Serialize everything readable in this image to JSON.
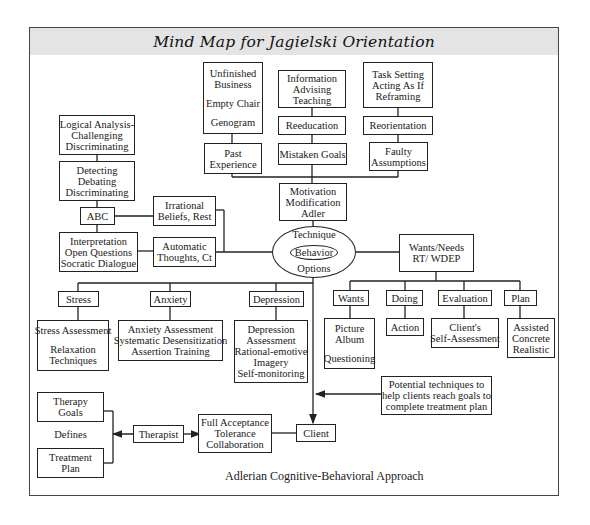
{
  "title": "Mind Map for Jagielski Orientation",
  "caption": "Adlerian Cognitive-Behavioral Approach",
  "center": {
    "top": "Technique",
    "inner": "Behavior",
    "bottom": "Options"
  },
  "top_branch": {
    "hub": [
      "Motivation",
      "Modification",
      "Adler"
    ],
    "columns": [
      {
        "detail": [
          "Unfinished",
          "Business",
          "",
          "Empty Chair",
          "",
          "Genogram"
        ],
        "concept": [
          "Past",
          "Experience"
        ]
      },
      {
        "detail": [
          "Information",
          "Advising",
          "Teaching"
        ],
        "middle": [
          "Reeducation"
        ],
        "concept": [
          "Mistaken Goals"
        ]
      },
      {
        "detail": [
          "Task Setting",
          "Acting As If",
          "Reframing"
        ],
        "middle": [
          "Reorientation"
        ],
        "concept": [
          "Faulty",
          "Assumptions"
        ]
      }
    ]
  },
  "left_branch": {
    "logical": [
      "Logical Analysis-",
      "Challenging",
      "Discriminating"
    ],
    "detecting": [
      "Detecting",
      "Debating",
      "Discriminating"
    ],
    "abc": "ABC",
    "interpretation": [
      "Interpretation",
      "Open Questions",
      "Socratic Dialogue"
    ],
    "irrational": [
      "Irrational",
      "Beliefs, Rest"
    ],
    "automatic": [
      "Automatic",
      "Thoughts, Ct"
    ]
  },
  "right_branch": {
    "hub": [
      "Wants/Needs",
      "RT/ WDEP"
    ],
    "items": [
      {
        "label": "Wants",
        "detail": [
          "Picture",
          "Album",
          "",
          "Questioning"
        ]
      },
      {
        "label": "Doing",
        "detail": [
          "Action"
        ]
      },
      {
        "label": "Evaluation",
        "detail": [
          "Client's",
          "Self-Assessment"
        ]
      },
      {
        "label": "Plan",
        "detail": [
          "Assisted",
          "Concrete",
          "Realistic"
        ]
      }
    ]
  },
  "lower_branch": {
    "items": [
      {
        "label": "Stress",
        "detail": [
          "Stress Assessment",
          "",
          "Relaxation",
          "Techniques"
        ]
      },
      {
        "label": "Anxiety",
        "detail": [
          "Anxiety Assessment",
          "Systematic Desensitization",
          "Assertion Training"
        ]
      },
      {
        "label": "Depression",
        "detail": [
          "Depression",
          "Assessment",
          "Rational-emotive",
          "Imagery",
          "Self-monitoring"
        ]
      }
    ]
  },
  "potential": [
    "Potential techniques to",
    "help clients reach goals to",
    "complete treatment plan"
  ],
  "bottom_row": {
    "therapy_goals": [
      "Therapy",
      "Goals"
    ],
    "defines": "Defines",
    "treatment_plan": [
      "Treatment",
      "Plan"
    ],
    "therapist": "Therapist",
    "acceptance": [
      "Full Acceptance",
      "Tolerance",
      "Collaboration"
    ],
    "client": "Client"
  },
  "colors": {
    "title_band": "#e4e4e4",
    "line": "#222222",
    "background": "#ffffff"
  }
}
